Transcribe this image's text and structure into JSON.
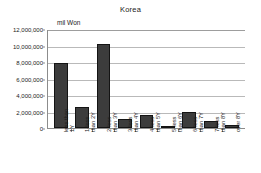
{
  "chart_data": {
    "type": "bar",
    "title": "Korea",
    "xlabel": "",
    "ylabel": "",
    "unit_label": "mil Won",
    "grid": true,
    "legend": "none",
    "ylim": [
      0,
      12000000
    ],
    "ytick_step": 2000000,
    "ytick_labels": [
      "12,000,000",
      "10,000,000",
      "8,000,000",
      "6,000,000",
      "4,000,000",
      "2,000,000",
      "0"
    ],
    "ytick_values": [
      12000000,
      10000000,
      8000000,
      6000000,
      4000000,
      2000000,
      0
    ],
    "categories": [
      "less than 1Y",
      "1-less than 2Y",
      "2-less than 3Y",
      "3-less than 4Y",
      "4-less than 5Y",
      "5-less than 6Y",
      "6-less than 7Y",
      "7-less than 8Y",
      "over 8Y"
    ],
    "category_lines": [
      [
        "less than",
        "1Y"
      ],
      [
        "1-less",
        "than 2Y"
      ],
      [
        "2-less",
        "than 3Y"
      ],
      [
        "3-less",
        "than 4Y"
      ],
      [
        "4-less",
        "than 5Y"
      ],
      [
        "5-less",
        "than 6Y"
      ],
      [
        "6-less",
        "than 7Y"
      ],
      [
        "7-less",
        "than 8Y"
      ],
      [
        "over 8Y",
        ""
      ]
    ],
    "values": [
      7850000,
      2600000,
      10200000,
      1050000,
      1550000,
      250000,
      1900000,
      850000,
      350000
    ],
    "colors": {
      "bar_fill": "#3c3c3c",
      "bar_border": "#141414",
      "gridline": "#b9b9b9",
      "axis": "#8c8c8c",
      "text": "#1b1b1b",
      "background": "#ffffff"
    }
  }
}
